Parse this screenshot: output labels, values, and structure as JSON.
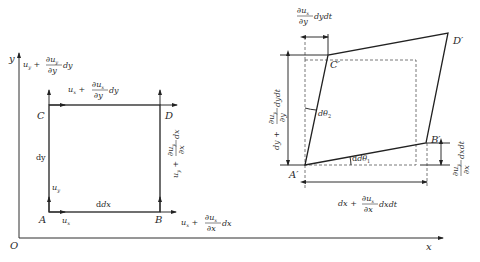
{
  "figure": {
    "left_panel": {
      "axes": {
        "x_label": "x",
        "y_label": "y",
        "origin_label": "O"
      },
      "corners": {
        "A": "A",
        "B": "B",
        "C": "C",
        "D": "D"
      },
      "side_labels": {
        "bottom": "dx",
        "left": "dy"
      },
      "velocity_labels": {
        "at_A_x": "u",
        "at_A_x_sub": "x",
        "at_A_y": "u",
        "at_A_y_sub": "y",
        "at_B": {
          "base": "u",
          "sub": "x",
          "plus": "+",
          "num": "∂u",
          "num_sub": "x",
          "den": "∂x",
          "tail": "dx"
        },
        "at_C_x": {
          "base": "u",
          "sub": "x",
          "plus": "+",
          "num": "∂u",
          "num_sub": "x",
          "den": "∂y",
          "tail": "dy"
        },
        "at_C_y": {
          "base": "u",
          "sub": "y",
          "plus": "+",
          "num": "∂u",
          "num_sub": "y",
          "den": "∂y",
          "tail": "dy"
        },
        "at_B_y": {
          "base": "u",
          "sub": "y",
          "plus": "+",
          "num": "∂u",
          "num_sub": "y",
          "den": "∂x",
          "tail": "dx"
        }
      }
    },
    "right_panel": {
      "corners": {
        "A": "A′",
        "B": "B′",
        "C": "C′",
        "D": "D′"
      },
      "angles": {
        "theta1": "dθ",
        "theta1_sub": "1",
        "theta2": "dθ",
        "theta2_sub": "2"
      },
      "dims": {
        "top": {
          "num": "∂u",
          "num_sub": "x",
          "den": "∂y",
          "tail": "dydt"
        },
        "left": {
          "head": "dy +",
          "num": "∂u",
          "num_sub": "y",
          "den": "∂y",
          "tail": "dydt"
        },
        "bottom": {
          "head": "dx +",
          "num": "∂u",
          "num_sub": "x",
          "den": "∂x",
          "tail": "dxdt"
        },
        "right": {
          "num": "∂u",
          "num_sub": "y",
          "den": "∂x",
          "tail": "dxdt"
        }
      }
    }
  }
}
